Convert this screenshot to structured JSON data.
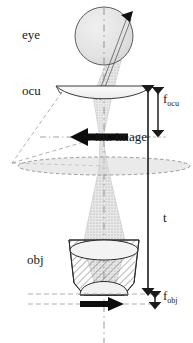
{
  "figure": {
    "type": "optical-ray-diagram",
    "width": 193,
    "height": 343,
    "background_color": "#ffffff"
  },
  "labels": {
    "eye": "eye",
    "ocular": "ocu",
    "objective": "obj",
    "intermediate_image": "int. image"
  },
  "dimensions": {
    "f_ocular_symbol": "f",
    "f_ocular_subscript": "ocu",
    "tube_length_symbol": "t",
    "f_objective_symbol": "f",
    "f_objective_subscript": "obj"
  },
  "colors": {
    "ink": "#1a1a1a",
    "line": "#2b2b2b",
    "eye_fill": "#e3e3e3",
    "lens_fill": "#f2f2f2",
    "beam_fill": "#d8d8d8",
    "hatch": "#4a4a4a",
    "construction": "#8a8a8a",
    "dashed_plane": "#9a9a9a",
    "plane_fill": "#d9d9d9"
  },
  "geometry": {
    "optical_axis_x": 104,
    "eye_center": {
      "x": 104,
      "y": 36
    },
    "eye_radius": 29,
    "ocular_lens": {
      "cx": 104,
      "cy": 92,
      "half_width": 49,
      "top_y": 86,
      "sag": 12
    },
    "intermediate_image_plane_y": 137,
    "field_plane_y": 166,
    "objective_top_y": 240,
    "objective_bottom_y": 295,
    "focal_plane_y": 302,
    "f_ocu_span": {
      "top": 86,
      "bottom": 137
    },
    "t_span": {
      "top": 166,
      "bottom": 295
    },
    "f_obj_span": {
      "top": 295,
      "bottom": 305
    }
  }
}
